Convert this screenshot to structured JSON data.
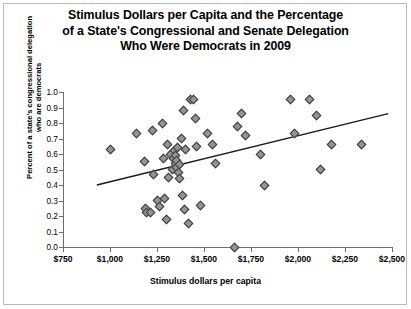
{
  "chart_data": {
    "type": "scatter",
    "title": "Stimulus Dollars per Capita and the Percentage of a State's Congressional and Senate Delegation Who Were Democrats in 2009",
    "title_lines": [
      "Stimulus Dollars per Capita and the Percentage",
      "of a State's Congressional and Senate Delegation",
      "Who Were Democrats in 2009"
    ],
    "xlabel": "Stimulus dollars per capita",
    "ylabel": "Percent of a state's congressional delegation who are democrats",
    "ylabel_lines": [
      "Percent of a state's congressional delegation",
      "who are democrats"
    ],
    "xlim": [
      750,
      2500
    ],
    "ylim": [
      0.0,
      1.0
    ],
    "xticks": [
      750,
      1000,
      1250,
      1500,
      1750,
      2000,
      2250,
      2500
    ],
    "xticklabels": [
      "$750",
      "$1,000",
      "$1,250",
      "$1,500",
      "$1,750",
      "$2,000",
      "$2,250",
      "$2,500"
    ],
    "yticks": [
      0.0,
      0.1,
      0.2,
      0.3,
      0.4,
      0.5,
      0.6,
      0.7,
      0.8,
      0.9,
      1.0
    ],
    "yticklabels": [
      "0.0",
      "0.1",
      "0.2",
      "0.3",
      "0.4",
      "0.5",
      "0.6",
      "0.7",
      "0.8",
      "0.9",
      "1.0"
    ],
    "grid": false,
    "legend": false,
    "marker_style": "diamond",
    "marker_fill": "#949494",
    "marker_edge": "#3a3a3a",
    "trendline": {
      "type": "linear",
      "color": "#1a1a1a",
      "x_start": 930,
      "y_start": 0.4,
      "x_end": 2480,
      "y_end": 0.86
    },
    "points": [
      {
        "x": 1000,
        "y": 0.63
      },
      {
        "x": 1140,
        "y": 0.73
      },
      {
        "x": 1185,
        "y": 0.55
      },
      {
        "x": 1190,
        "y": 0.25
      },
      {
        "x": 1195,
        "y": 0.22
      },
      {
        "x": 1215,
        "y": 0.22
      },
      {
        "x": 1225,
        "y": 0.75
      },
      {
        "x": 1230,
        "y": 0.47
      },
      {
        "x": 1250,
        "y": 0.3
      },
      {
        "x": 1265,
        "y": 0.26
      },
      {
        "x": 1280,
        "y": 0.8
      },
      {
        "x": 1285,
        "y": 0.57
      },
      {
        "x": 1290,
        "y": 0.31
      },
      {
        "x": 1300,
        "y": 0.18
      },
      {
        "x": 1305,
        "y": 0.66
      },
      {
        "x": 1310,
        "y": 0.45
      },
      {
        "x": 1320,
        "y": 0.6
      },
      {
        "x": 1330,
        "y": 0.5
      },
      {
        "x": 1338,
        "y": 0.57
      },
      {
        "x": 1342,
        "y": 0.62
      },
      {
        "x": 1346,
        "y": 0.54
      },
      {
        "x": 1350,
        "y": 0.59
      },
      {
        "x": 1352,
        "y": 0.51
      },
      {
        "x": 1356,
        "y": 0.56
      },
      {
        "x": 1360,
        "y": 0.64
      },
      {
        "x": 1362,
        "y": 0.48
      },
      {
        "x": 1368,
        "y": 0.53
      },
      {
        "x": 1372,
        "y": 0.44
      },
      {
        "x": 1380,
        "y": 0.7
      },
      {
        "x": 1385,
        "y": 0.33
      },
      {
        "x": 1390,
        "y": 0.88
      },
      {
        "x": 1395,
        "y": 0.24
      },
      {
        "x": 1400,
        "y": 0.63
      },
      {
        "x": 1420,
        "y": 0.15
      },
      {
        "x": 1430,
        "y": 0.95
      },
      {
        "x": 1445,
        "y": 0.95
      },
      {
        "x": 1455,
        "y": 0.83
      },
      {
        "x": 1460,
        "y": 0.65
      },
      {
        "x": 1480,
        "y": 0.27
      },
      {
        "x": 1520,
        "y": 0.73
      },
      {
        "x": 1545,
        "y": 0.66
      },
      {
        "x": 1560,
        "y": 0.54
      },
      {
        "x": 1660,
        "y": 0.0
      },
      {
        "x": 1680,
        "y": 0.78
      },
      {
        "x": 1700,
        "y": 0.86
      },
      {
        "x": 1720,
        "y": 0.72
      },
      {
        "x": 1800,
        "y": 0.6
      },
      {
        "x": 1820,
        "y": 0.4
      },
      {
        "x": 1960,
        "y": 0.95
      },
      {
        "x": 1980,
        "y": 0.73
      },
      {
        "x": 2060,
        "y": 0.95
      },
      {
        "x": 2100,
        "y": 0.85
      },
      {
        "x": 2120,
        "y": 0.5
      },
      {
        "x": 2180,
        "y": 0.66
      },
      {
        "x": 2340,
        "y": 0.66
      }
    ]
  }
}
